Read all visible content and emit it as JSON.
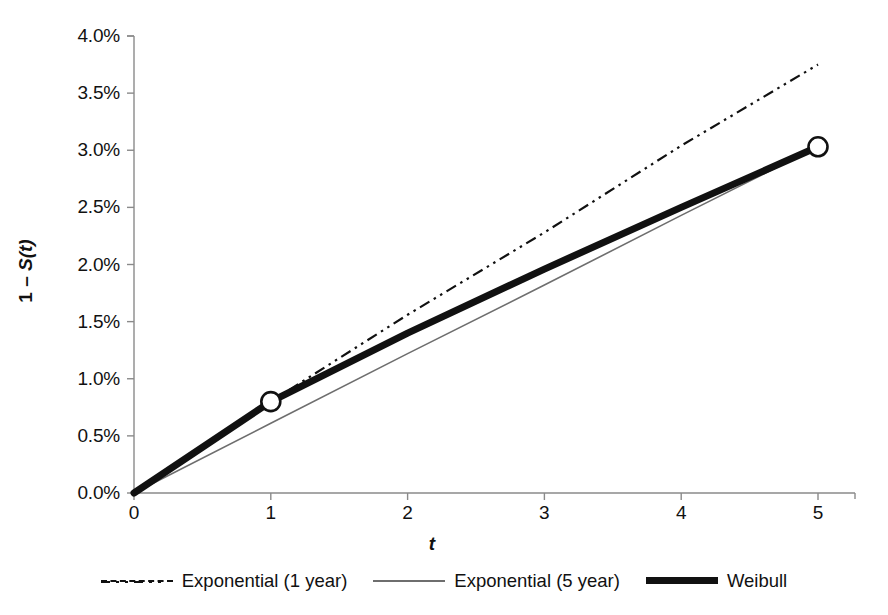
{
  "chart_data": {
    "type": "line",
    "title": "",
    "xlabel": "t",
    "ylabel": "1 – S(t)",
    "xlim": [
      0,
      5
    ],
    "ylim": [
      0,
      0.04
    ],
    "grid": false,
    "legend_position": "bottom",
    "x_ticks": [
      "0",
      "1",
      "2",
      "3",
      "4",
      "5"
    ],
    "x_tick_values": [
      0,
      1,
      2,
      3,
      4,
      5
    ],
    "y_ticks": [
      "0.0%",
      "0.5%",
      "1.0%",
      "1.5%",
      "2.0%",
      "2.5%",
      "3.0%",
      "3.5%",
      "4.0%"
    ],
    "y_tick_values": [
      0.0,
      0.005,
      0.01,
      0.015,
      0.02,
      0.025,
      0.03,
      0.035,
      0.04
    ],
    "series": [
      {
        "name": "Exponential (1 year)",
        "style": "dash-dot",
        "color": "#111111",
        "width": 2.2,
        "x": [
          0,
          1,
          2,
          3,
          4,
          5
        ],
        "values": [
          0.0,
          0.008,
          0.0156,
          0.0228,
          0.0304,
          0.0375
        ]
      },
      {
        "name": "Exponential (5 year)",
        "style": "solid-thin",
        "color": "#6e6e6e",
        "width": 1.6,
        "x": [
          0,
          1,
          2,
          3,
          4,
          5
        ],
        "values": [
          0.0,
          0.0061,
          0.0122,
          0.0182,
          0.0243,
          0.0303
        ]
      },
      {
        "name": "Weibull",
        "style": "solid-thick",
        "color": "#111111",
        "width": 7,
        "marker": "open-circle",
        "marker_x": [
          1,
          5
        ],
        "marker_values": [
          0.008,
          0.0303
        ],
        "x": [
          0,
          1,
          2,
          3,
          4,
          5
        ],
        "values": [
          0.0,
          0.008,
          0.014,
          0.0196,
          0.025,
          0.0303
        ]
      }
    ]
  },
  "legend": {
    "items": [
      {
        "label": "Exponential (1 year)",
        "swatch": "dash-dot-line-icon"
      },
      {
        "label": "Exponential (5 year)",
        "swatch": "thin-solid-line-icon"
      },
      {
        "label": "Weibull",
        "swatch": "thick-solid-line-icon"
      }
    ]
  },
  "axes": {
    "y_title_prefix": "1 – ",
    "y_title_func": "S(t)",
    "x_title": "t"
  }
}
